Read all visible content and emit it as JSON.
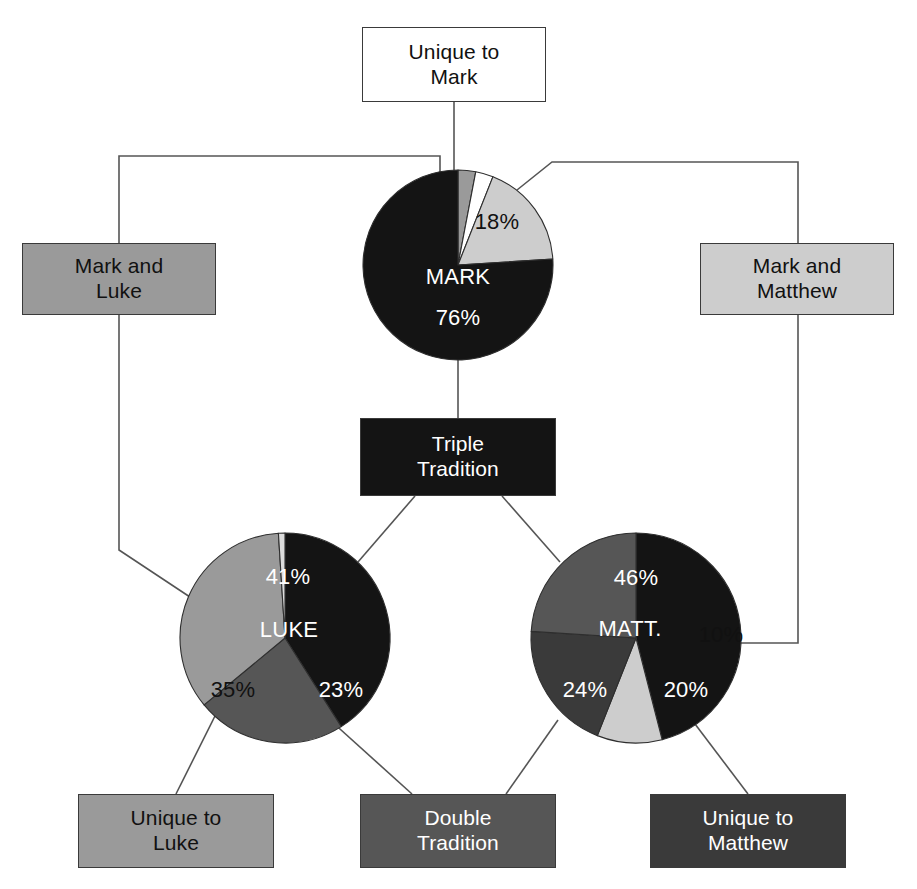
{
  "diagram": {
    "background": "#ffffff",
    "palette": {
      "black": "#141414",
      "very_dark_gray": "#3a3a3a",
      "dark_gray": "#565656",
      "medium_gray": "#9a9a9a",
      "light_gray": "#cdcdcd",
      "white": "#ffffff",
      "outline": "#3a3a3a",
      "connector": "#555555"
    }
  },
  "boxes": [
    {
      "id": "unique-to-mark",
      "label": "Unique to\nMark",
      "fill": "#ffffff",
      "text_color": "#111111",
      "x": 362,
      "y": 27,
      "w": 184,
      "h": 75
    },
    {
      "id": "mark-and-luke",
      "label": "Mark and\nLuke",
      "fill": "#9a9a9a",
      "text_color": "#111111",
      "x": 22,
      "y": 243,
      "w": 194,
      "h": 72
    },
    {
      "id": "mark-and-matthew",
      "label": "Mark and\nMatthew",
      "fill": "#cdcdcd",
      "text_color": "#111111",
      "x": 700,
      "y": 243,
      "w": 194,
      "h": 72
    },
    {
      "id": "triple-tradition",
      "label": "Triple\nTradition",
      "fill": "#141414",
      "text_color": "#ffffff",
      "x": 360,
      "y": 418,
      "w": 196,
      "h": 78
    },
    {
      "id": "unique-to-luke",
      "label": "Unique to\nLuke",
      "fill": "#9a9a9a",
      "text_color": "#111111",
      "x": 78,
      "y": 794,
      "w": 196,
      "h": 74
    },
    {
      "id": "double-tradition",
      "label": "Double\nTradition",
      "fill": "#565656",
      "text_color": "#ffffff",
      "x": 360,
      "y": 794,
      "w": 196,
      "h": 74
    },
    {
      "id": "unique-to-matthew",
      "label": "Unique to\nMatthew",
      "fill": "#3a3a3a",
      "text_color": "#ffffff",
      "x": 650,
      "y": 794,
      "w": 196,
      "h": 74
    }
  ],
  "chart_data": [
    {
      "id": "mark-pie",
      "type": "pie",
      "title": "MARK",
      "center": [
        458,
        265
      ],
      "radius": 95,
      "start_angle": -90,
      "labels": [
        "Mark and Luke",
        "Unique to Mark",
        "Mark and Matthew",
        "Triple Tradition"
      ],
      "values": [
        3,
        3,
        18,
        76
      ],
      "colors": [
        "#9a9a9a",
        "#ffffff",
        "#cdcdcd",
        "#141414"
      ],
      "data_labels": [
        "",
        "",
        "18%",
        "76%"
      ],
      "caption": "MARK",
      "caption_color": "#ffffff",
      "caption_pos": [
        458,
        277
      ],
      "label_positions": {
        "18%": [
          497,
          222
        ],
        "76%": [
          458,
          318
        ]
      }
    },
    {
      "id": "luke-pie",
      "type": "pie",
      "title": "LUKE",
      "center": [
        285,
        638
      ],
      "radius": 105,
      "start_angle": -90,
      "labels": [
        "Triple Tradition",
        "Double Tradition",
        "Unique to Luke",
        "Mark and Luke"
      ],
      "values": [
        41,
        23,
        35,
        1
      ],
      "colors": [
        "#141414",
        "#565656",
        "#9a9a9a",
        "#dcdcdc"
      ],
      "data_labels": [
        "41%",
        "23%",
        "35%",
        ""
      ],
      "caption": "LUKE",
      "caption_color": "#ffffff",
      "caption_pos": [
        289,
        630
      ],
      "label_positions": {
        "41%": [
          288,
          577
        ],
        "23%": [
          341,
          690
        ],
        "35%": [
          233,
          690
        ]
      }
    },
    {
      "id": "matthew-pie",
      "type": "pie",
      "title": "MATT.",
      "center": [
        636,
        638
      ],
      "radius": 105,
      "start_angle": -90,
      "labels": [
        "Triple Tradition",
        "Mark and Matthew",
        "Unique to Matthew",
        "Double Tradition"
      ],
      "values": [
        46,
        10,
        20,
        24
      ],
      "colors": [
        "#141414",
        "#cdcdcd",
        "#3a3a3a",
        "#565656"
      ],
      "data_labels": [
        "46%",
        "10%",
        "20%",
        "24%"
      ],
      "caption": "MATT.",
      "caption_color": "#ffffff",
      "caption_pos": [
        630,
        629
      ],
      "label_positions": {
        "46%": [
          636,
          578
        ],
        "10%": [
          721,
          635
        ],
        "24%": [
          585,
          690
        ],
        "20%": [
          686,
          690
        ]
      }
    }
  ],
  "connectors": [
    {
      "id": "unique-to-mark-to-mark-pie",
      "points": "454,102 454,192"
    },
    {
      "id": "mark-and-luke-to-mark-pie",
      "points": "119,243 119,156 440,156 440,190"
    },
    {
      "id": "mark-and-matthew-to-mark-pie",
      "points": "517,190 552,162 798,162 798,243"
    },
    {
      "id": "mark-pie-to-triple-tradition",
      "points": "458,360 458,418"
    },
    {
      "id": "triple-tradition-to-luke-pie",
      "points": "415,496 358,562"
    },
    {
      "id": "triple-tradition-to-matthew-pie",
      "points": "502,496 560,562"
    },
    {
      "id": "mark-and-luke-to-luke-pie",
      "points": "119,315 119,550 196,601"
    },
    {
      "id": "mark-and-matthew-to-matthew-pie",
      "points": "798,315 798,643 739,643"
    },
    {
      "id": "luke-pie-to-unique-to-luke",
      "points": "215,716 176,794"
    },
    {
      "id": "luke-pie-to-double-tradition",
      "points": "330,720 412,794"
    },
    {
      "id": "matthew-pie-to-double-tradition",
      "points": "558,720 506,794"
    },
    {
      "id": "matthew-pie-to-unique-to-matthew",
      "points": "692,720 748,794"
    }
  ]
}
